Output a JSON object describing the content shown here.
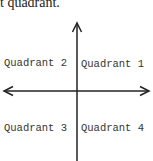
{
  "caption": "t quadrant.",
  "diagram": {
    "type": "coordinate-plane-quadrants",
    "quadrants": [
      {
        "id": 1,
        "label": "Quadrant 1",
        "position": "upper-right"
      },
      {
        "id": 2,
        "label": "Quadrant 2",
        "position": "upper-left"
      },
      {
        "id": 3,
        "label": "Quadrant 3",
        "position": "lower-left"
      },
      {
        "id": 4,
        "label": "Quadrant 4",
        "position": "lower-right"
      }
    ],
    "axis_color": "#222222"
  }
}
